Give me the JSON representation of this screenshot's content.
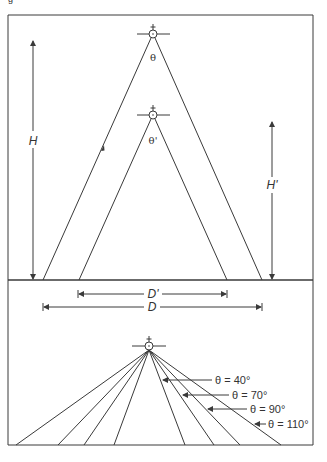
{
  "figure": {
    "caption_fragment": "g",
    "colors": {
      "line": "#3a3a3a",
      "text": "#333333",
      "background": "#ffffff"
    }
  },
  "top_panel": {
    "outer_source": {
      "angle_label": "θ",
      "height_label": "H",
      "width_label": "D"
    },
    "inner_source": {
      "angle_label": "θ'",
      "height_label": "H'",
      "width_label": "D'"
    }
  },
  "bottom_panel": {
    "beam_labels": [
      {
        "label": "θ = 40°",
        "angle_deg": 40
      },
      {
        "label": "θ = 70°",
        "angle_deg": 70
      },
      {
        "label": "θ = 90°",
        "angle_deg": 90
      },
      {
        "label": "θ = 110°",
        "angle_deg": 110
      }
    ]
  }
}
